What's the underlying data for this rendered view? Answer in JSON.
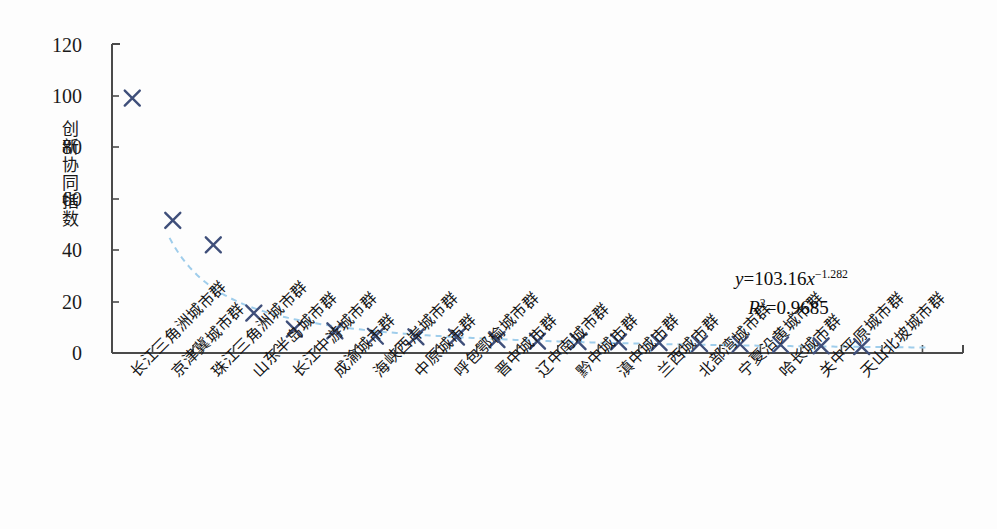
{
  "chart_data": {
    "type": "scatter",
    "title": "",
    "xlabel": "",
    "ylabel": "创新协同指数",
    "ylim": [
      0,
      120
    ],
    "yticks": [
      0,
      20,
      40,
      60,
      80,
      100,
      120
    ],
    "grid": false,
    "legend": null,
    "marker": "x",
    "marker_color": "#3f4f7a",
    "trendline": {
      "style": "dashed",
      "color": "#9fcdeb",
      "equation": "y=103.16x^-1.282",
      "r_squared": 0.9685,
      "coefficient": 103.16,
      "exponent": -1.282
    },
    "categories": [
      "长江三角洲城市群",
      "京津冀城市群",
      "珠江三角洲城市群",
      "山东半岛城市群",
      "长江中游城市群",
      "成渝城市群",
      "海峡西岸城市群",
      "中原城市群",
      "呼包鄂榆城市群",
      "晋中城市群",
      "辽中南城市群",
      "黔中城市群",
      "滇中城市群",
      "兰西城市群",
      "北部湾城市群",
      "宁夏沿黄城市群",
      "哈长城市群",
      "关中平原城市群",
      "天山北坡城市群"
    ],
    "values": [
      99.0,
      51.5,
      42.0,
      15.5,
      9.3,
      8.6,
      6.5,
      6.3,
      6.2,
      5.2,
      4.6,
      4.4,
      4.3,
      4.0,
      3.6,
      3.4,
      3.2,
      2.8,
      2.5
    ]
  },
  "axis": {
    "ytick_labels": [
      "120",
      "100",
      "80",
      "60",
      "40",
      "20",
      "0"
    ]
  },
  "annotation": {
    "equation_y": "y",
    "equation_body": "=103.16",
    "equation_x": "x",
    "equation_exp": "−1.282",
    "r_symbol": "R",
    "r_sup": "2",
    "r_value": "=0.9685"
  }
}
